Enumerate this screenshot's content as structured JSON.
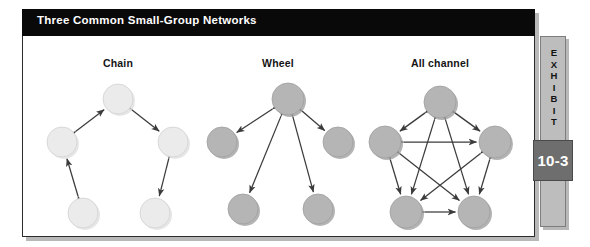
{
  "exhibit": {
    "title": "Three Common Small-Group Networks",
    "tab_label": "EXHIBIT",
    "tab_letters": [
      "E",
      "X",
      "H",
      "I",
      "B",
      "I",
      "T"
    ],
    "tab_number": "10-3"
  },
  "colors": {
    "title_bar": "#090909",
    "title_text": "#ffffff",
    "panel_background": "#ffffff",
    "panel_border": "#2b2b2b",
    "node_light": "#ebebeb",
    "node_light_stroke": "#d2d2d2",
    "node_mid": "#b5b5b5",
    "node_mid_stroke": "#a0a0a0",
    "arrow": "#3b3b3b",
    "tab_strip": "#bdbdbd",
    "tab_number_box": "#6e6e6e",
    "label_text": "#141414"
  },
  "diagrams": [
    {
      "id": "chain",
      "label": "Chain",
      "label_x": 96,
      "label_y": 31,
      "node_fill": "node_light",
      "nodes": [
        {
          "id": "top",
          "x": 96,
          "y": 63,
          "r": 15
        },
        {
          "id": "mid-left",
          "x": 40,
          "y": 106,
          "r": 15
        },
        {
          "id": "mid-right",
          "x": 151,
          "y": 106,
          "r": 15
        },
        {
          "id": "bottom-left",
          "x": 61,
          "y": 177,
          "r": 15
        },
        {
          "id": "bottom-right",
          "x": 133,
          "y": 177,
          "r": 15
        }
      ],
      "edges": [
        {
          "from": "mid-left",
          "to": "top"
        },
        {
          "from": "top",
          "to": "mid-right"
        },
        {
          "from": "bottom-left",
          "to": "mid-left"
        },
        {
          "from": "mid-right",
          "to": "bottom-right"
        }
      ]
    },
    {
      "id": "wheel",
      "label": "Wheel",
      "label_x": 256,
      "label_y": 31,
      "node_fill": "node_mid",
      "nodes": [
        {
          "id": "center",
          "x": 266,
          "y": 63,
          "r": 16
        },
        {
          "id": "left",
          "x": 200,
          "y": 106,
          "r": 15
        },
        {
          "id": "right",
          "x": 316,
          "y": 106,
          "r": 15
        },
        {
          "id": "bottom-left",
          "x": 221,
          "y": 173,
          "r": 15
        },
        {
          "id": "bottom-right",
          "x": 296,
          "y": 173,
          "r": 15
        }
      ],
      "edges": [
        {
          "from": "center",
          "to": "left"
        },
        {
          "from": "center",
          "to": "right"
        },
        {
          "from": "center",
          "to": "bottom-left"
        },
        {
          "from": "center",
          "to": "bottom-right"
        }
      ]
    },
    {
      "id": "all-channel",
      "label": "All channel",
      "label_x": 418,
      "label_y": 31,
      "node_fill": "node_mid",
      "nodes": [
        {
          "id": "top",
          "x": 418,
          "y": 66,
          "r": 16
        },
        {
          "id": "left",
          "x": 363,
          "y": 106,
          "r": 16
        },
        {
          "id": "right",
          "x": 473,
          "y": 106,
          "r": 16
        },
        {
          "id": "bottom-left",
          "x": 384,
          "y": 176,
          "r": 16
        },
        {
          "id": "bottom-right",
          "x": 452,
          "y": 176,
          "r": 16
        }
      ],
      "edges": [
        {
          "from": "top",
          "to": "left"
        },
        {
          "from": "top",
          "to": "right"
        },
        {
          "from": "top",
          "to": "bottom-left"
        },
        {
          "from": "top",
          "to": "bottom-right"
        },
        {
          "from": "left",
          "to": "right"
        },
        {
          "from": "left",
          "to": "bottom-left"
        },
        {
          "from": "left",
          "to": "bottom-right"
        },
        {
          "from": "right",
          "to": "bottom-left"
        },
        {
          "from": "right",
          "to": "bottom-right"
        },
        {
          "from": "bottom-left",
          "to": "bottom-right"
        }
      ]
    }
  ]
}
